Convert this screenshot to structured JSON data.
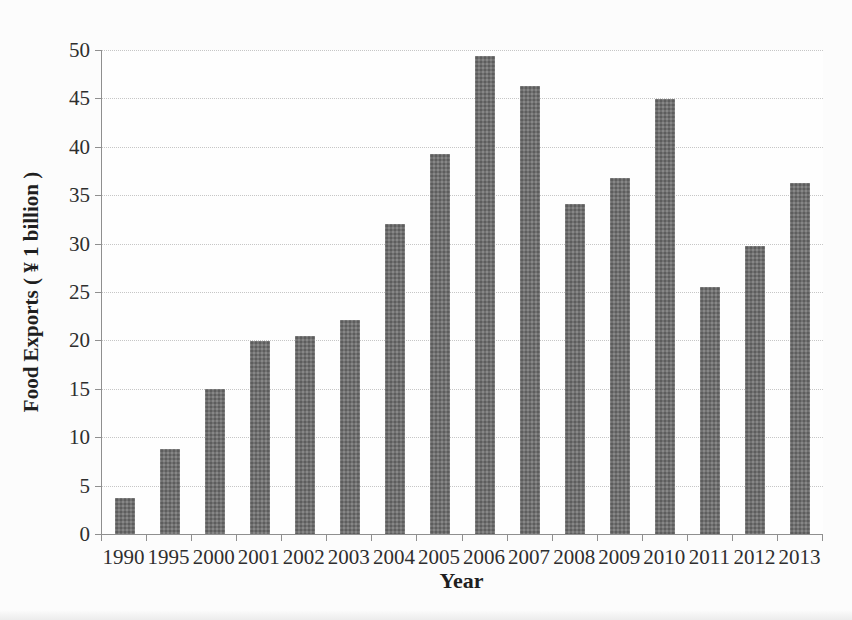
{
  "chart_data": {
    "type": "bar",
    "title": "",
    "categories": [
      "1990",
      "1995",
      "2000",
      "2001",
      "2002",
      "2003",
      "2004",
      "2005",
      "2006",
      "2007",
      "2008",
      "2009",
      "2010",
      "2011",
      "2012",
      "2013"
    ],
    "values": [
      3.7,
      8.8,
      15.0,
      19.9,
      20.5,
      22.1,
      32.0,
      39.3,
      49.4,
      46.3,
      34.1,
      36.8,
      44.9,
      25.5,
      29.8,
      36.3
    ],
    "xlabel": "Year",
    "ylabel": "Food Exports ( ¥ 1 billion )",
    "ylim": [
      0,
      50
    ],
    "yticks": [
      0,
      5,
      10,
      15,
      20,
      25,
      30,
      35,
      40,
      45,
      50
    ],
    "grid": true,
    "gridline_style": "dotted",
    "legend_position": "none",
    "bar_color": "#717171",
    "gridline_color": "#c6c6c6",
    "axis_color": "#8f8f8f",
    "text_color": "#2e2e2e"
  }
}
